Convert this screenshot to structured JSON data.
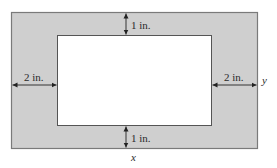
{
  "diagram": {
    "type": "framed-rectangle-dimensions",
    "colors": {
      "frame_fill": "#cfcfcf",
      "frame_border": "#7a7a7a",
      "inner_fill": "#ffffff",
      "inner_border": "#555555",
      "arrow": "#222222",
      "text": "#2a2a2a"
    },
    "labels": {
      "top_margin": "1 in.",
      "bottom_margin": "1 in.",
      "left_margin": "2 in.",
      "right_margin": "2 in.",
      "height_var": "y",
      "width_var": "x"
    }
  }
}
